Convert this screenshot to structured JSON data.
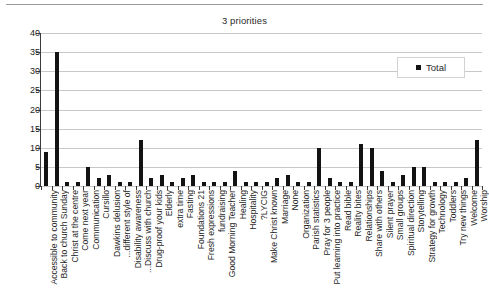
{
  "chart_data": {
    "type": "bar",
    "title": "3 priorities",
    "xlabel": "",
    "ylabel": "",
    "ylim": [
      0,
      40
    ],
    "yticks": [
      0,
      5,
      10,
      15,
      20,
      25,
      30,
      35,
      40
    ],
    "grid": true,
    "legend_position": "top-right",
    "series": [
      {
        "name": "Total",
        "color": "#131313",
        "values": [
          9,
          35,
          1,
          1,
          5,
          2,
          3,
          1,
          1,
          12,
          2,
          3,
          1,
          2,
          3,
          1,
          1,
          1,
          4,
          1,
          1,
          1,
          2,
          3,
          1,
          1,
          10,
          2,
          1,
          1,
          11,
          10,
          4,
          1,
          3,
          5,
          5,
          1,
          1,
          1,
          2,
          12
        ]
      }
    ],
    "categories": [
      "Accessible to community",
      "Back to church Sunday",
      "Christ at the centre",
      "Come next year",
      "Communication",
      "Cursillo",
      "Dawkins delusion",
      "different style of...",
      "Disability awareness",
      "Discuss with church...",
      "Drug-proof your kids",
      "Elderly",
      "extra time",
      "Fasting",
      "Foundations 21",
      "Fresh expressions",
      "fundraising",
      "Good Morning Teacher",
      "Healing",
      "Hospitality",
      "LYCIG?",
      "Make Christ known",
      "Marriage",
      "None",
      "Organization",
      "Parish statistics",
      "Pray for 3 people",
      "Put learning into practice",
      "Read bible",
      "Reality bites",
      "Relationships",
      "Share with others",
      "Silent prayer",
      "Small groups",
      "Spiritual direction",
      "Storytelling",
      "Strategy for growth",
      "Technology",
      "Toddlers",
      "Try new things",
      "Welcome",
      "Worship"
    ]
  },
  "legend": {
    "entries": [
      {
        "label": "Total",
        "color": "#131313"
      }
    ]
  }
}
